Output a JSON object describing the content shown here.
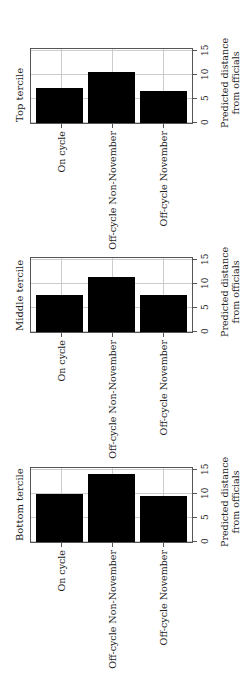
{
  "chart_data": [
    {
      "type": "bar",
      "title": "Top tercile",
      "categories": [
        "On cycle",
        "Off-cycle Non-November",
        "Off-cycle November"
      ],
      "values": [
        7.0,
        10.5,
        6.4
      ],
      "xlabel": "",
      "ylabel": "Predicted distance from officials",
      "ylim": [
        0,
        15
      ],
      "yticks": [
        0,
        5,
        10,
        15
      ],
      "grid": true,
      "orientation": "rotated 90deg"
    },
    {
      "type": "bar",
      "title": "Middle tercile",
      "categories": [
        "On cycle",
        "Off-cycle Non-November",
        "Off-cycle November"
      ],
      "values": [
        7.6,
        11.3,
        7.4
      ],
      "xlabel": "",
      "ylabel": "Predicted distance from officials",
      "ylim": [
        0,
        15
      ],
      "yticks": [
        0,
        5,
        10,
        15
      ],
      "grid": true,
      "orientation": "rotated 90deg"
    },
    {
      "type": "bar",
      "title": "Bottom tercile",
      "categories": [
        "On cycle",
        "Off-cycle Non-November",
        "Off-cycle November"
      ],
      "values": [
        9.8,
        14.0,
        9.3
      ],
      "xlabel": "",
      "ylabel": "Predicted distance from officials",
      "ylim": [
        0,
        15
      ],
      "yticks": [
        0,
        5,
        10,
        15
      ],
      "grid": true,
      "orientation": "rotated 90deg"
    }
  ],
  "panels": [
    {
      "title": "Top tercile",
      "ylabel_line1": "Predicted distance",
      "ylabel_line2": "from officials",
      "ticks": [
        "0",
        "5",
        "10",
        "15"
      ],
      "categories": [
        "On cycle",
        "Off-cycle Non-November",
        "Off-cycle November"
      ]
    },
    {
      "title": "Middle tercile",
      "ylabel_line1": "Predicted distance",
      "ylabel_line2": "from officials",
      "ticks": [
        "0",
        "5",
        "10",
        "15"
      ],
      "categories": [
        "On cycle",
        "Off-cycle Non-November",
        "Off-cycle November"
      ]
    },
    {
      "title": "Bottom tercile",
      "ylabel_line1": "Predicted distance",
      "ylabel_line2": "from officials",
      "ticks": [
        "0",
        "5",
        "10",
        "15"
      ],
      "categories": [
        "On cycle",
        "Off-cycle Non-November",
        "Off-cycle November"
      ]
    }
  ]
}
